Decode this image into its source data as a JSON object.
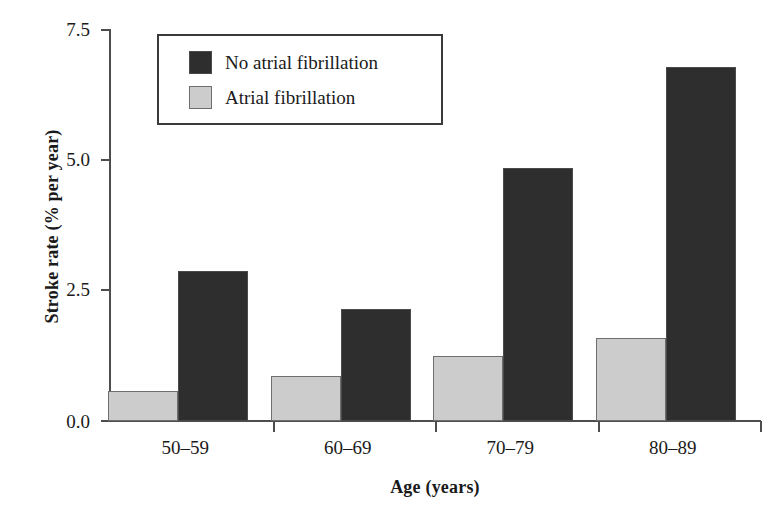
{
  "figure": {
    "top_caption": ""
  },
  "chart_data": {
    "type": "bar",
    "title": "",
    "xlabel": "Age (years)",
    "ylabel": "Stroke rate (% per year)",
    "categories": [
      "50–59",
      "60–69",
      "70–79",
      "80–89"
    ],
    "series": [
      {
        "name": "No atrial fibrillation",
        "color": "#2e2e2e",
        "values": [
          2.87,
          2.15,
          4.85,
          6.78
        ]
      },
      {
        "name": "Atrial fibrillation",
        "color": "#cccccc",
        "values": [
          0.58,
          0.86,
          1.25,
          1.58
        ]
      }
    ],
    "ylim": [
      0.0,
      7.5
    ],
    "ytick_labels": [
      "0.0",
      "2.5",
      "5.0",
      "7.5"
    ],
    "ytick_values": [
      0.0,
      2.5,
      5.0,
      7.5
    ],
    "grid": false,
    "legend_position": "top-left-inside",
    "bar_order_in_group": [
      "Atrial fibrillation",
      "No atrial fibrillation"
    ]
  },
  "legend": {
    "entries": [
      {
        "label": "No atrial fibrillation",
        "swatch": "dark-swatch-icon"
      },
      {
        "label": "Atrial fibrillation",
        "swatch": "light-swatch-icon"
      }
    ]
  }
}
